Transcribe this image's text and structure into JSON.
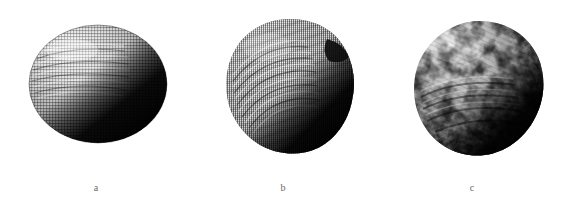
{
  "figure": {
    "background_color": "#ffffff",
    "width": 577,
    "height": 199,
    "panel_count": 3
  },
  "panels": [
    {
      "id": "a",
      "label": "a",
      "shape": "ellipsoid",
      "texture": "fine regular woven grid mesh",
      "light_direction": "upper-left",
      "highlight_color": "#e8e8e8",
      "midtone_color": "#6f6f6f",
      "shadow_color": "#090909",
      "bounds": {
        "x": 28,
        "y": 24,
        "width": 140,
        "height": 120
      }
    },
    {
      "id": "b",
      "label": "b",
      "shape": "sphere",
      "texture": "dense fine dotted crosshatch mesh with lumpy silhouette",
      "light_direction": "upper-left",
      "highlight_color": "#c9c9c9",
      "midtone_color": "#565656",
      "shadow_color": "#060606",
      "bounds": {
        "x": 223,
        "y": 17,
        "width": 134,
        "height": 139
      }
    },
    {
      "id": "c",
      "label": "c",
      "shape": "sphere",
      "texture": "knobbly high-contrast displaced bumps",
      "light_direction": "upper-left",
      "highlight_color": "#f2f2f2",
      "midtone_color": "#717171",
      "shadow_color": "#070707",
      "bounds": {
        "x": 411,
        "y": 19,
        "width": 136,
        "height": 140
      }
    }
  ],
  "captions": {
    "a": "a",
    "b": "b",
    "c": "c",
    "color": "#6a6a6a"
  }
}
